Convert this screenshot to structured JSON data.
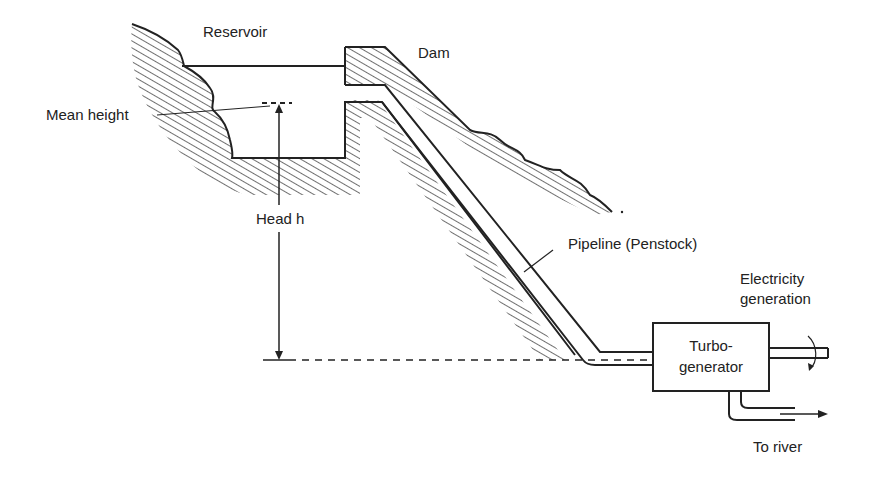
{
  "diagram": {
    "type": "hydroelectric-power-plant-schematic",
    "labels": {
      "reservoir": "Reservoir",
      "dam": "Dam",
      "mean_height": "Mean height",
      "head": "Head h",
      "pipeline": "Pipeline (Penstock)",
      "electricity_line1": "Electricity",
      "electricity_line2": "generation",
      "turbo_line1": "Turbo-",
      "turbo_line2": "generator",
      "to_river": "To river"
    },
    "colors": {
      "ink": "#222222",
      "background": "#ffffff"
    }
  }
}
